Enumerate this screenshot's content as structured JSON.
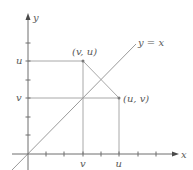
{
  "figure": {
    "type": "coordinate-diagram",
    "colors": {
      "axis": "#6e6e6e",
      "guide_lines": "#a8a8a8",
      "diagonal": "#9a9a9a",
      "text": "#5a5a5a",
      "background": "#ffffff"
    }
  },
  "axes": {
    "x_label": "x",
    "y_label": "y",
    "x_ticks_count": 7,
    "y_ticks_count": 6,
    "x_tick_labels": {
      "v": "v",
      "u": "u"
    },
    "y_tick_labels": {
      "u": "u",
      "v": "v"
    }
  },
  "line": {
    "label": "y = x"
  },
  "points": [
    {
      "id": "p1",
      "label": "(v, u)",
      "x_units": 3,
      "y_units": 5
    },
    {
      "id": "p2",
      "label": "(u, v)",
      "x_units": 5,
      "y_units": 3
    }
  ]
}
